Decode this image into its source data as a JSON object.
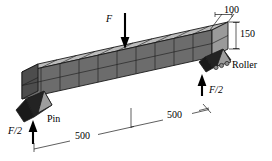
{
  "figure": {
    "name": "simply-supported-beam-3d-diagram",
    "background_color": "#ffffff",
    "line_color": "#1a1a1a"
  },
  "beam": {
    "top_face_color": "#b9b9b9",
    "front_face_color": "#6a6a6a",
    "end_face_color": "#4a4a4a",
    "mesh_segments": 10,
    "mesh_rows": 2
  },
  "supports": {
    "pin": {
      "label": "Pin",
      "wedge_color": "#262626",
      "triangle_color": "#9a9a9a"
    },
    "roller": {
      "label": "Roller",
      "wedge_color": "#262626",
      "triangle_color": "#9a9a9a",
      "roller_color": "#8f8f8f"
    }
  },
  "loads": {
    "applied_force": {
      "label": "F",
      "direction": "down",
      "location": "midspan-top"
    },
    "left_reaction": {
      "label": "F/2",
      "direction": "up",
      "location": "pin-support"
    },
    "right_reaction": {
      "label": "F/2",
      "direction": "up",
      "location": "roller-support"
    }
  },
  "dimensions": [
    {
      "id": "width",
      "value": "100",
      "orientation": "leader-top-right"
    },
    {
      "id": "depth",
      "value": "150",
      "orientation": "vertical-right"
    },
    {
      "id": "span-left",
      "value": "500",
      "orientation": "oblique-bottom"
    },
    {
      "id": "span-right",
      "value": "500",
      "orientation": "oblique-bottom"
    }
  ]
}
